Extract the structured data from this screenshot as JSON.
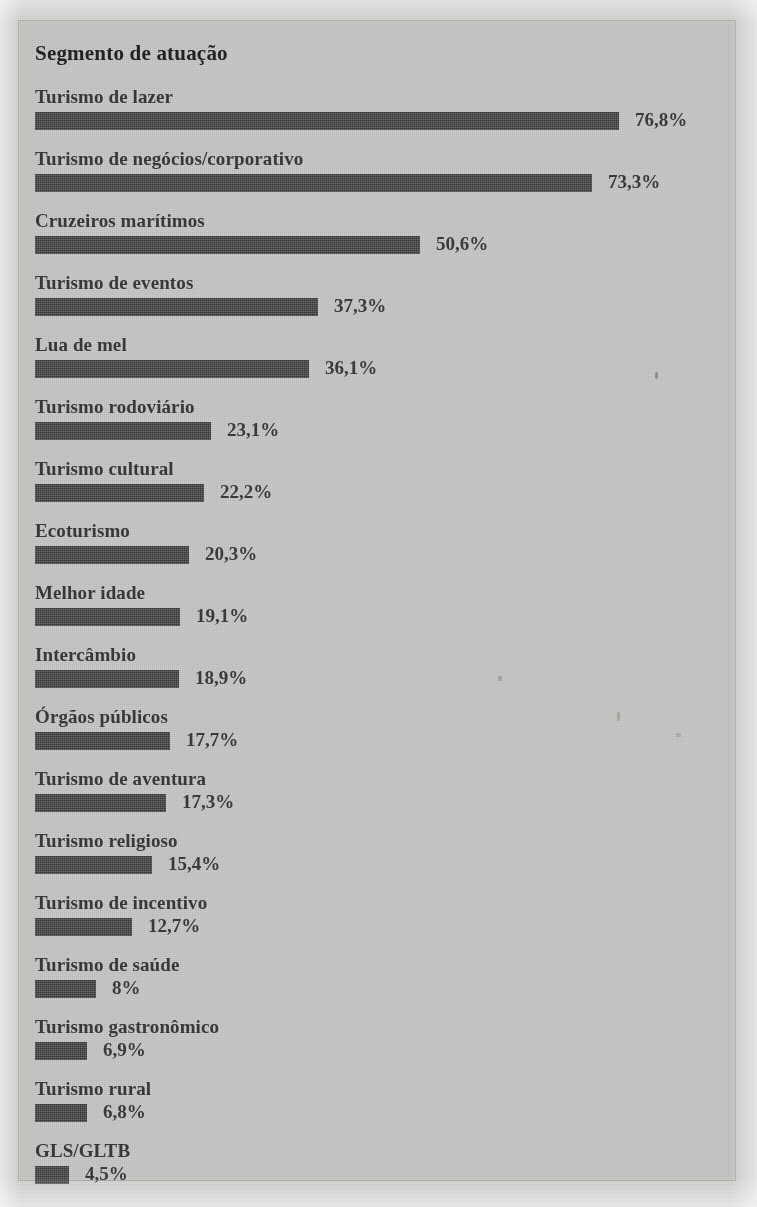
{
  "panel": {
    "title": "Segmento de atuação"
  },
  "colors": {
    "page_background": "#d2d2d0",
    "panel_background": "#c9c9c7",
    "bar_fill": "#4a4a4a",
    "label_text": "#3a3a3a",
    "title_text": "#232323"
  },
  "chart_data": {
    "type": "bar",
    "title": "Segmento de atuação",
    "xlabel": "",
    "ylabel": "",
    "orientation": "horizontal",
    "grid": false,
    "legend": "none",
    "xlim": [
      0,
      80
    ],
    "value_suffix": "%",
    "decimal_separator": ",",
    "categories": [
      "Turismo de lazer",
      "Turismo de negócios/corporativo",
      "Cruzeiros marítimos",
      "Turismo de eventos",
      "Lua de mel",
      "Turismo rodoviário",
      "Turismo cultural",
      "Ecoturismo",
      "Melhor idade",
      "Intercâmbio",
      "Órgãos públicos",
      "Turismo de aventura",
      "Turismo religioso",
      "Turismo de incentivo",
      "Turismo de saúde",
      "Turismo gastronômico",
      "Turismo rural",
      "GLS/GLTB"
    ],
    "values": [
      76.8,
      73.3,
      50.6,
      37.3,
      36.1,
      23.1,
      22.2,
      20.3,
      19.1,
      18.9,
      17.7,
      17.3,
      15.4,
      12.7,
      8,
      6.9,
      6.8,
      4.5
    ],
    "value_labels": [
      "76,8%",
      "73,3%",
      "50,6%",
      "37,3%",
      "36,1%",
      "23,1%",
      "22,2%",
      "20,3%",
      "19,1%",
      "18,9%",
      "17,7%",
      "17,3%",
      "15,4%",
      "12,7%",
      "8%",
      "6,9%",
      "6,8%",
      "4,5%"
    ]
  }
}
